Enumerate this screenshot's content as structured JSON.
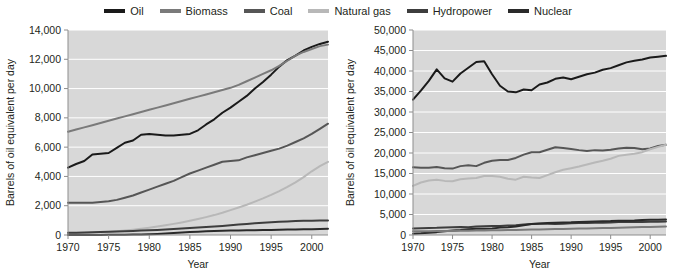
{
  "legend": {
    "position": "top-center",
    "items": [
      {
        "label": "Oil",
        "color": "#1a1a1a",
        "icon": "line-swatch-icon"
      },
      {
        "label": "Biomass",
        "color": "#7a7a7a",
        "icon": "line-swatch-icon"
      },
      {
        "label": "Coal",
        "color": "#565656",
        "icon": "line-swatch-icon"
      },
      {
        "label": "Natural gas",
        "color": "#b8b8b8",
        "icon": "line-swatch-icon"
      },
      {
        "label": "Hydropower",
        "color": "#3d3d3d",
        "icon": "line-swatch-icon"
      },
      {
        "label": "Nuclear",
        "color": "#2a2a2a",
        "icon": "line-swatch-icon"
      }
    ]
  },
  "chart_data": [
    {
      "id": "left",
      "type": "line",
      "title": "",
      "xlabel": "Year",
      "ylabel": "Barrels of oil equivalent per day",
      "xlim": [
        1970,
        2002
      ],
      "ylim": [
        0,
        14000
      ],
      "xticks": [
        1970,
        1975,
        1980,
        1985,
        1990,
        1995,
        2000
      ],
      "yticks": [
        0,
        2000,
        4000,
        6000,
        8000,
        10000,
        12000,
        14000
      ],
      "ytick_labels": [
        "0",
        "2,000",
        "4,000",
        "6,000",
        "8,000",
        "10,000",
        "12,000",
        "14,000"
      ],
      "xtick_labels": [
        "1970",
        "1975",
        "1980",
        "1985",
        "1990",
        "1995",
        "2000"
      ],
      "grid": "horizontal",
      "plot_background": "#d8d8d8",
      "x": [
        1970,
        1971,
        1972,
        1973,
        1974,
        1975,
        1976,
        1977,
        1978,
        1979,
        1980,
        1981,
        1982,
        1983,
        1984,
        1985,
        1986,
        1987,
        1988,
        1989,
        1990,
        1991,
        1992,
        1993,
        1994,
        1995,
        1996,
        1997,
        1998,
        1999,
        2000,
        2001,
        2002
      ],
      "series": [
        {
          "name": "Oil",
          "color": "#1a1a1a",
          "values": [
            4600,
            4850,
            5050,
            5500,
            5550,
            5600,
            5950,
            6300,
            6450,
            6850,
            6900,
            6850,
            6800,
            6800,
            6850,
            6900,
            7150,
            7550,
            7900,
            8350,
            8700,
            9100,
            9500,
            10000,
            10450,
            10950,
            11500,
            11950,
            12250,
            12600,
            12850,
            13050,
            13200
          ]
        },
        {
          "name": "Biomass",
          "color": "#7a7a7a",
          "values": [
            7050,
            7200,
            7350,
            7500,
            7650,
            7800,
            7950,
            8100,
            8250,
            8400,
            8550,
            8700,
            8850,
            9000,
            9150,
            9300,
            9450,
            9600,
            9750,
            9900,
            10050,
            10250,
            10500,
            10750,
            11000,
            11250,
            11550,
            11900,
            12250,
            12500,
            12700,
            12900,
            13000
          ]
        },
        {
          "name": "Coal",
          "color": "#565656",
          "values": [
            2200,
            2200,
            2200,
            2200,
            2250,
            2300,
            2400,
            2550,
            2700,
            2900,
            3100,
            3300,
            3500,
            3700,
            3950,
            4200,
            4400,
            4600,
            4800,
            5000,
            5050,
            5100,
            5300,
            5450,
            5600,
            5750,
            5900,
            6100,
            6350,
            6600,
            6900,
            7250,
            7600
          ]
        },
        {
          "name": "Natural gas",
          "color": "#b8b8b8",
          "values": [
            80,
            100,
            120,
            150,
            180,
            210,
            250,
            300,
            360,
            430,
            500,
            580,
            670,
            760,
            860,
            970,
            1090,
            1220,
            1360,
            1520,
            1700,
            1880,
            2070,
            2280,
            2500,
            2740,
            3000,
            3280,
            3600,
            3950,
            4350,
            4700,
            5000
          ]
        },
        {
          "name": "Hydropower",
          "color": "#3d3d3d",
          "values": [
            150,
            160,
            175,
            190,
            205,
            220,
            235,
            255,
            275,
            300,
            325,
            350,
            380,
            410,
            440,
            475,
            510,
            545,
            580,
            620,
            665,
            710,
            755,
            800,
            840,
            875,
            905,
            930,
            950,
            965,
            975,
            985,
            990
          ]
        },
        {
          "name": "Nuclear",
          "color": "#2a2a2a",
          "values": [
            0,
            0,
            0,
            0,
            5,
            10,
            15,
            20,
            30,
            40,
            55,
            75,
            100,
            130,
            165,
            200,
            230,
            255,
            275,
            290,
            300,
            310,
            320,
            330,
            340,
            350,
            360,
            370,
            380,
            390,
            400,
            410,
            420
          ]
        }
      ]
    },
    {
      "id": "right",
      "type": "line",
      "title": "",
      "xlabel": "Year",
      "ylabel": "Barrels of oil equivalent per day",
      "xlim": [
        1970,
        2002
      ],
      "ylim": [
        0,
        50000
      ],
      "xticks": [
        1970,
        1975,
        1980,
        1985,
        1990,
        1995,
        2000
      ],
      "yticks": [
        0,
        5000,
        10000,
        15000,
        20000,
        25000,
        30000,
        35000,
        40000,
        45000,
        50000
      ],
      "ytick_labels": [
        "0",
        "5,000",
        "10,000",
        "15,000",
        "20,000",
        "25,000",
        "30,000",
        "35,000",
        "40,000",
        "45,000",
        "50,000"
      ],
      "xtick_labels": [
        "1970",
        "1975",
        "1980",
        "1985",
        "1990",
        "1995",
        "2000"
      ],
      "grid": "horizontal",
      "plot_background": "#d8d8d8",
      "x": [
        1970,
        1971,
        1972,
        1973,
        1974,
        1975,
        1976,
        1977,
        1978,
        1979,
        1980,
        1981,
        1982,
        1983,
        1984,
        1985,
        1986,
        1987,
        1988,
        1989,
        1990,
        1991,
        1992,
        1993,
        1994,
        1995,
        1996,
        1997,
        1998,
        1999,
        2000,
        2001,
        2002
      ],
      "series": [
        {
          "name": "Oil",
          "color": "#1a1a1a",
          "values": [
            33000,
            35200,
            37600,
            40400,
            38200,
            37400,
            39400,
            40800,
            42200,
            42400,
            39200,
            36400,
            35000,
            34800,
            35500,
            35300,
            36700,
            37200,
            38100,
            38400,
            38000,
            38600,
            39200,
            39600,
            40300,
            40700,
            41400,
            42100,
            42500,
            42800,
            43300,
            43500,
            43700
          ]
        },
        {
          "name": "Coal",
          "color": "#565656",
          "values": [
            16500,
            16400,
            16400,
            16600,
            16300,
            16200,
            16800,
            17000,
            16800,
            17600,
            18100,
            18300,
            18300,
            18800,
            19600,
            20200,
            20200,
            20800,
            21400,
            21200,
            21000,
            20700,
            20500,
            20700,
            20600,
            20800,
            21100,
            21300,
            21200,
            20900,
            21100,
            21700,
            22000
          ]
        },
        {
          "name": "Natural gas",
          "color": "#b8b8b8",
          "values": [
            12000,
            12800,
            13300,
            13500,
            13200,
            13100,
            13600,
            13800,
            13900,
            14400,
            14400,
            14200,
            13700,
            13500,
            14200,
            14000,
            13900,
            14600,
            15300,
            15900,
            16300,
            16700,
            17200,
            17700,
            18100,
            18600,
            19300,
            19600,
            19800,
            20200,
            20900,
            21500,
            22000
          ]
        },
        {
          "name": "Hydropower",
          "color": "#3d3d3d",
          "values": [
            1600,
            1650,
            1700,
            1750,
            1850,
            1900,
            1950,
            1900,
            2100,
            2150,
            2200,
            2200,
            2300,
            2400,
            2550,
            2700,
            2750,
            2750,
            2700,
            2750,
            2850,
            2900,
            2900,
            3000,
            3000,
            3050,
            3150,
            3150,
            3150,
            3200,
            3250,
            3250,
            3300
          ]
        },
        {
          "name": "Nuclear",
          "color": "#2a2a2a",
          "values": [
            300,
            400,
            550,
            700,
            900,
            1100,
            1200,
            1400,
            1500,
            1500,
            1600,
            1800,
            1900,
            2100,
            2400,
            2700,
            2800,
            2900,
            3000,
            3050,
            3100,
            3200,
            3250,
            3300,
            3350,
            3400,
            3500,
            3500,
            3550,
            3650,
            3700,
            3750,
            3800
          ]
        },
        {
          "name": "Biomass",
          "color": "#7a7a7a",
          "values": [
            900,
            920,
            940,
            960,
            980,
            1000,
            1030,
            1060,
            1090,
            1120,
            1150,
            1180,
            1210,
            1250,
            1290,
            1330,
            1370,
            1410,
            1450,
            1490,
            1530,
            1570,
            1610,
            1650,
            1690,
            1730,
            1780,
            1830,
            1880,
            1930,
            1980,
            2030,
            2080
          ]
        }
      ]
    }
  ]
}
